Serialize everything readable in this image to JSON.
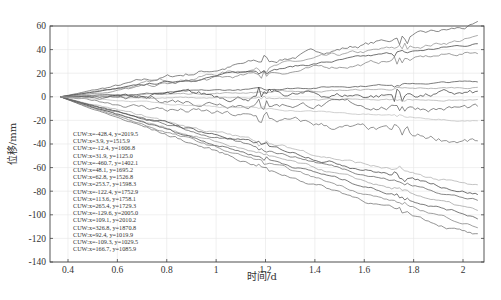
{
  "chart_data": {
    "type": "line",
    "title": "",
    "xlabel": "时间/d",
    "ylabel": "位移/mm",
    "xlim": [
      0.33,
      2.085
    ],
    "ylim": [
      -140,
      60
    ],
    "xticks": [
      0.4,
      0.6,
      0.8,
      1,
      1.2,
      1.4,
      1.6,
      1.8,
      2
    ],
    "xtick_labels": [
      "0.4",
      "0.6",
      "0.8",
      "1",
      "1.2",
      "1.4",
      "1.6",
      "1.8",
      "2"
    ],
    "yticks": [
      60,
      40,
      20,
      0,
      -20,
      -40,
      -60,
      -80,
      -100,
      -120,
      -140
    ],
    "ytick_labels": [
      "60",
      "40",
      "20",
      "0",
      "-20",
      "-40",
      "-60",
      "-80",
      "-100",
      "-120",
      "-140"
    ],
    "grid": true,
    "legend_position": "lower left (inside)",
    "series": [
      {
        "name": "CUW:x=-428.4, y=2019.5",
        "end": 60,
        "noise": 3,
        "color": "#555"
      },
      {
        "name": "CUW:x=3.9, y=1515.9",
        "end": 50,
        "noise": 2.5,
        "color": "#888"
      },
      {
        "name": "CUW:x=-12.4, y=1606.8",
        "end": 45,
        "noise": 1.5,
        "color": "#333"
      },
      {
        "name": "CUW:x=31.9, y=1125.0",
        "end": 38,
        "noise": 2.5,
        "color": "#777"
      },
      {
        "name": "CUW:x=-460.7, y=1402.1",
        "end": 13,
        "noise": 1,
        "color": "#444"
      },
      {
        "name": "CUW:x=48.1, y=1695.2",
        "end": 8,
        "noise": 1,
        "color": "#999"
      },
      {
        "name": "CUW:x=62.8, y=1526.8",
        "end": 2,
        "noise": 4,
        "color": "#333"
      },
      {
        "name": "CUW:x=253.7, y=1598.3",
        "end": -3,
        "noise": 1,
        "color": "#aaa"
      },
      {
        "name": "CUW:x=-122.4, y=1752.9",
        "end": -10,
        "noise": 4,
        "color": "#555"
      },
      {
        "name": "CUW:x=113.6, y=1758.1",
        "end": -38,
        "noise": 4,
        "color": "#666"
      },
      {
        "name": "CUW:x=265.4, y=1729.3",
        "end": -77,
        "noise": 2,
        "color": "#aaa"
      },
      {
        "name": "CUW:x=-129.6, y=2005.0",
        "end": -82,
        "noise": 2,
        "color": "#333"
      },
      {
        "name": "CUW:x=109.1, y=2010.2",
        "end": -88,
        "noise": 1.5,
        "color": "#555"
      },
      {
        "name": "CUW:x=326.8, y=1870.8",
        "end": -97,
        "noise": 1.5,
        "color": "#999"
      },
      {
        "name": "CUW:x=92.4, y=1019.9",
        "end": -102,
        "noise": 1.5,
        "color": "#444"
      },
      {
        "name": "CUW:x=-109.3, y=1029.5",
        "end": -110,
        "noise": 1.5,
        "color": "#777"
      },
      {
        "name": "CUW:x=166.7, y=1085.9",
        "end": -118,
        "noise": 2,
        "color": "#666"
      },
      {
        "name": "CUW:x=-55.1, y=1122.6",
        "end": -20,
        "noise": 1,
        "color": "#bbb"
      }
    ],
    "x_start": 0.37,
    "x_end": 2.06
  },
  "captions": {
    "top": "",
    "bottom": ""
  }
}
